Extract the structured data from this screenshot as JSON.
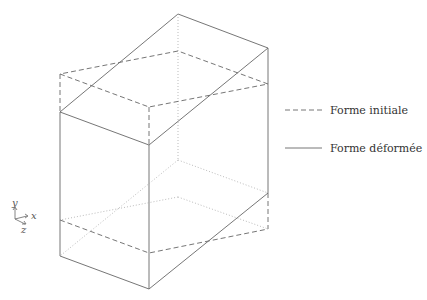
{
  "legend": {
    "initial_label": "Forme initiale",
    "deformed_label": "Forme déformée"
  },
  "axes": {
    "x_label": "x",
    "y_label": "y",
    "z_label": "z"
  },
  "colors": {
    "stroke": "#666666",
    "hidden": "#aaaaaa"
  }
}
